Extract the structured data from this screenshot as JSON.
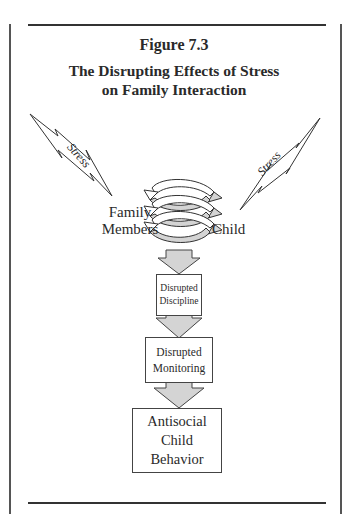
{
  "figure": {
    "number": "Figure 7.3",
    "title_line1": "The Disrupting Effects of Stress",
    "title_line2": "on Family Interaction"
  },
  "stress_left": {
    "label": "Stress"
  },
  "stress_right": {
    "label": "Stress"
  },
  "interaction": {
    "left_label_line1": "Family",
    "left_label_line2": "Members",
    "right_label": "Child"
  },
  "flow": [
    {
      "line1": "Disrupted",
      "line2": "Discipline"
    },
    {
      "line1": "Disrupted",
      "line2": "Monitoring"
    },
    {
      "line1": "Antisocial",
      "line2": "Child",
      "line3": "Behavior"
    }
  ],
  "colors": {
    "arrow_fill": "#d4d4d4",
    "line": "#333333"
  }
}
